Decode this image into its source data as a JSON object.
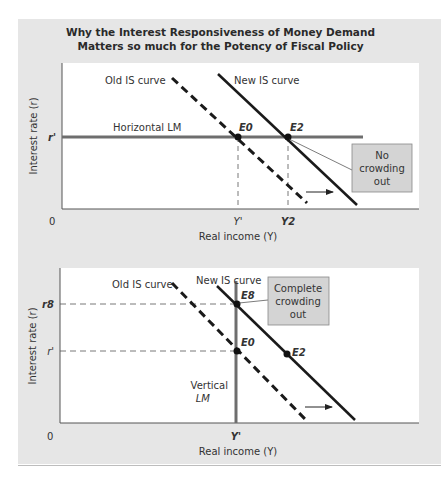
{
  "figure": {
    "title_line1": "Why the Interest Responsiveness of Money Demand",
    "title_line2": "Matters so much for the Potency of Fiscal Policy"
  },
  "top_panel": {
    "y_axis_label": "Interest rate (r)",
    "x_axis_label": "Real income (Y)",
    "origin_label": "0",
    "y_ticks": [
      {
        "label": "r'",
        "y": 137
      }
    ],
    "x_ticks": [
      {
        "label": "Y'",
        "x": 238
      },
      {
        "label": "Y2",
        "x": 288
      }
    ],
    "curves": {
      "old_is": {
        "label": "Old IS curve",
        "style": "dashed"
      },
      "new_is": {
        "label": "New IS curve",
        "style": "solid"
      },
      "lm": {
        "label": "Horizontal LM",
        "style": "solid-gray"
      }
    },
    "points": [
      {
        "label": "E0",
        "x": 238,
        "y": 137
      },
      {
        "label": "E2",
        "x": 288,
        "y": 137
      }
    ],
    "callout": {
      "line1": "No",
      "line2": "crowding",
      "line3": "out"
    }
  },
  "bottom_panel": {
    "y_axis_label": "Interest rate (r)",
    "x_axis_label": "Real income (Y)",
    "origin_label": "0",
    "y_ticks": [
      {
        "label": "r8",
        "y": 304
      },
      {
        "label": "r'",
        "y": 351
      }
    ],
    "x_ticks": [
      {
        "label": "Y'",
        "x": 236
      }
    ],
    "curves": {
      "old_is": {
        "label": "Old IS curve",
        "style": "dashed"
      },
      "new_is": {
        "label": "New IS curve",
        "style": "solid"
      },
      "lm": {
        "label_line1": "Vertical",
        "label_line2": "LM",
        "style": "solid-gray"
      }
    },
    "points": [
      {
        "label": "E8",
        "x": 237,
        "y": 304
      },
      {
        "label": "E0",
        "x": 237,
        "y": 351
      },
      {
        "label": "E2",
        "x": 287,
        "y": 354
      }
    ],
    "callout": {
      "line1": "Complete",
      "line2": "crowding",
      "line3": "out"
    }
  },
  "colors": {
    "panel_bg": "#e6e6e6",
    "plot_bg": "#ffffff",
    "lm_line": "#6e6e6e",
    "is_line": "#1a1a1a",
    "callout_bg": "#d4d4d4"
  }
}
